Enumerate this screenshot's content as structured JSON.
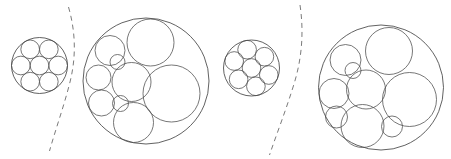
{
  "figure": {
    "width": 451,
    "height": 159,
    "background_color": "#ffffff",
    "stroke_color": "#3a3a3a",
    "inner_stroke_color": "#4a4a4a",
    "dashed_color": "#7a7a7a",
    "panel_count": 4,
    "separator_count": 2
  },
  "packings": [
    {
      "id": "packing-1",
      "label": "small-equal-7",
      "kind": "equal-circles",
      "container": {
        "cx": 39.5,
        "cy": 65.5,
        "r": 28.0
      },
      "circle_count": 7,
      "rotation_deg": 0,
      "circles": [
        {
          "cx": 39.5,
          "cy": 65.5,
          "r": 9.33
        },
        {
          "cx": 58.16,
          "cy": 65.5,
          "r": 9.33
        },
        {
          "cx": 48.83,
          "cy": 49.34,
          "r": 9.33
        },
        {
          "cx": 30.17,
          "cy": 49.34,
          "r": 9.33
        },
        {
          "cx": 20.84,
          "cy": 65.5,
          "r": 9.33
        },
        {
          "cx": 30.17,
          "cy": 81.66,
          "r": 9.33
        },
        {
          "cx": 48.83,
          "cy": 81.66,
          "r": 9.33
        }
      ]
    },
    {
      "id": "packing-2",
      "label": "large-unequal-9",
      "kind": "unequal-circles",
      "container": {
        "cx": 146.0,
        "cy": 81.0,
        "r": 63.0
      },
      "circle_count": 9,
      "rotation_deg": 0,
      "circles": [
        {
          "cx": 150.5,
          "cy": 42.5,
          "r": 23.5
        },
        {
          "cx": 171.5,
          "cy": 93.5,
          "r": 28.5
        },
        {
          "cx": 131.5,
          "cy": 82.0,
          "r": 19.5
        },
        {
          "cx": 110.0,
          "cy": 50.5,
          "r": 15.0
        },
        {
          "cx": 98.5,
          "cy": 77.5,
          "r": 12.5
        },
        {
          "cx": 101.5,
          "cy": 103.0,
          "r": 13.0
        },
        {
          "cx": 133.5,
          "cy": 122.5,
          "r": 20.0
        },
        {
          "cx": 120.5,
          "cy": 103.5,
          "r": 8.0
        },
        {
          "cx": 117.5,
          "cy": 62.0,
          "r": 7.5
        }
      ]
    },
    {
      "id": "packing-3",
      "label": "small-equal-7-rotated",
      "kind": "equal-circles",
      "container": {
        "cx": 251.5,
        "cy": 68.0,
        "r": 28.0
      },
      "circle_count": 7,
      "rotation_deg": 22,
      "circles": [
        {
          "cx": 251.5,
          "cy": 68.0,
          "r": 9.33
        },
        {
          "cx": 268.8,
          "cy": 75.0,
          "r": 9.33
        },
        {
          "cx": 264.4,
          "cy": 56.7,
          "r": 9.33
        },
        {
          "cx": 247.1,
          "cy": 49.7,
          "r": 9.33
        },
        {
          "cx": 234.2,
          "cy": 61.0,
          "r": 9.33
        },
        {
          "cx": 238.6,
          "cy": 79.3,
          "r": 9.33
        },
        {
          "cx": 255.9,
          "cy": 86.3,
          "r": 9.33
        }
      ]
    },
    {
      "id": "packing-4",
      "label": "large-unequal-9-mirrored",
      "kind": "unequal-circles",
      "container": {
        "cx": 381.0,
        "cy": 87.5,
        "r": 62.5
      },
      "circle_count": 9,
      "rotation_deg": 0,
      "circles": [
        {
          "cx": 389.0,
          "cy": 51.0,
          "r": 23.5
        },
        {
          "cx": 409.5,
          "cy": 99.5,
          "r": 27.0
        },
        {
          "cx": 366.0,
          "cy": 89.5,
          "r": 19.5
        },
        {
          "cx": 345.5,
          "cy": 60.0,
          "r": 15.5
        },
        {
          "cx": 334.0,
          "cy": 93.5,
          "r": 15.0
        },
        {
          "cx": 362.5,
          "cy": 126.0,
          "r": 21.5
        },
        {
          "cx": 336.5,
          "cy": 117.0,
          "r": 11.0
        },
        {
          "cx": 353.0,
          "cy": 70.5,
          "r": 8.0
        },
        {
          "cx": 392.0,
          "cy": 126.5,
          "r": 10.5
        }
      ]
    }
  ],
  "separators": [
    {
      "id": "separator-1",
      "label": "dashed-arc-left",
      "style": "dashed",
      "path": "M 68.5 7 C 76 33 76 58 70 82 C 64 106 56 128 49.5 151"
    },
    {
      "id": "separator-2",
      "label": "dashed-arc-right",
      "style": "dashed",
      "path": "M 300 5 C 304 32 302 58 294 84 C 286 110 277 133 269.5 155"
    }
  ]
}
